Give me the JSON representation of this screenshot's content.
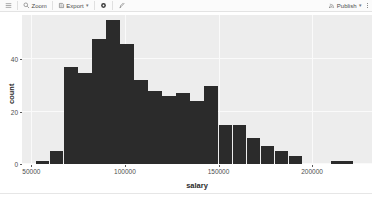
{
  "toolbar": {
    "menu_icon": "hamburger-icon",
    "zoom_label": "Zoom",
    "zoom_icon": "magnifier-icon",
    "export_label": "Export",
    "export_icon": "export-icon",
    "export_caret": "▾",
    "settings_icon": "gear-icon",
    "brush_icon": "brush-icon",
    "publish_label": "Publish",
    "publish_icon": "publish-icon",
    "publish_caret": "▾",
    "overflow_icon": "kebab-menu-icon"
  },
  "chart_data": {
    "type": "bar",
    "title": "",
    "subtitle": "",
    "xlabel": "salary",
    "ylabel": "count",
    "grid": true,
    "legend": null,
    "bar_color": "#2b2b2b",
    "panel_color": "#ededed",
    "xlim": [
      45000,
      232000
    ],
    "ylim": [
      0,
      57
    ],
    "x_ticks": [
      50000,
      100000,
      150000,
      200000
    ],
    "x_tick_labels": [
      "50000",
      "100000",
      "150000",
      "200000"
    ],
    "y_ticks": [
      0,
      20,
      40
    ],
    "y_tick_labels": [
      "0",
      "20",
      "40"
    ],
    "bin_width": 7500,
    "bins": [
      {
        "start": 52500,
        "end": 60000,
        "count": 1
      },
      {
        "start": 60000,
        "end": 67500,
        "count": 5
      },
      {
        "start": 67500,
        "end": 75000,
        "count": 37
      },
      {
        "start": 75000,
        "end": 82500,
        "count": 35
      },
      {
        "start": 82500,
        "end": 90000,
        "count": 48
      },
      {
        "start": 90000,
        "end": 97500,
        "count": 55
      },
      {
        "start": 97500,
        "end": 105000,
        "count": 46
      },
      {
        "start": 105000,
        "end": 112500,
        "count": 32
      },
      {
        "start": 112500,
        "end": 120000,
        "count": 28
      },
      {
        "start": 120000,
        "end": 127500,
        "count": 26
      },
      {
        "start": 127500,
        "end": 135000,
        "count": 27
      },
      {
        "start": 135000,
        "end": 142500,
        "count": 24
      },
      {
        "start": 142500,
        "end": 150000,
        "count": 30
      },
      {
        "start": 150000,
        "end": 157500,
        "count": 15
      },
      {
        "start": 157500,
        "end": 165000,
        "count": 15
      },
      {
        "start": 165000,
        "end": 172500,
        "count": 10
      },
      {
        "start": 172500,
        "end": 180000,
        "count": 7
      },
      {
        "start": 180000,
        "end": 187500,
        "count": 5
      },
      {
        "start": 187500,
        "end": 195000,
        "count": 3
      },
      {
        "start": 210000,
        "end": 222000,
        "count": 1
      }
    ],
    "categories": [
      "52500-60000",
      "60000-67500",
      "67500-75000",
      "75000-82500",
      "82500-90000",
      "90000-97500",
      "97500-105000",
      "105000-112500",
      "112500-120000",
      "120000-127500",
      "127500-135000",
      "135000-142500",
      "142500-150000",
      "150000-157500",
      "157500-165000",
      "165000-172500",
      "172500-180000",
      "180000-187500",
      "187500-195000",
      "210000-222000"
    ],
    "values": [
      1,
      5,
      37,
      35,
      48,
      55,
      46,
      32,
      28,
      26,
      27,
      24,
      30,
      15,
      15,
      10,
      7,
      5,
      3,
      1
    ]
  }
}
